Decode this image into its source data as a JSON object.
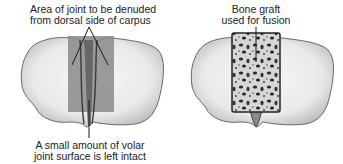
{
  "figure": {
    "left_panel": {
      "name": "Carpus with denuded area",
      "top_label": [
        "Area of joint to be denuded",
        "from dorsal side of carpus"
      ],
      "bottom_label": [
        "A small amount of volar",
        "joint surface is left intact"
      ]
    },
    "right_panel": {
      "name": "Carpus with bone graft",
      "top_label": [
        "Bone graft",
        "used for fusion"
      ]
    }
  },
  "colors": {
    "bone_fill": "#efefef",
    "bone_outline": "#6a6a6a",
    "denuded_area": "#8a8a8a",
    "graft_fill": "#d8d8d8",
    "graft_spots": "#2a2a2a",
    "leader_line": "#1a1a1a"
  }
}
